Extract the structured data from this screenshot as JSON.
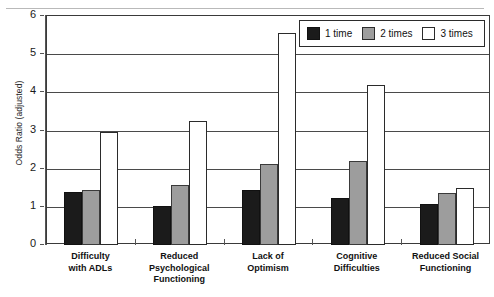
{
  "chart_data": {
    "type": "bar",
    "title": "",
    "xlabel": "",
    "ylabel": "Odds Ratio (adjusted)",
    "ylim": [
      0,
      6
    ],
    "yticks": [
      0,
      1,
      2,
      3,
      4,
      5,
      6
    ],
    "grid": true,
    "legend_position": "top-right",
    "categories": [
      "Difficulty with ADLs",
      "Reduced Psychological Functioning",
      "Lack of Optimism",
      "Cognitive Difficulties",
      "Reduced Social Functioning"
    ],
    "category_lines": [
      [
        "Difficulty",
        "with ADLs"
      ],
      [
        "Reduced",
        "Psychological",
        "Functioning"
      ],
      [
        "Lack of",
        "Optimism"
      ],
      [
        "Cognitive",
        "Difficulties"
      ],
      [
        "Reduced Social",
        "Functioning"
      ]
    ],
    "series": [
      {
        "name": "1 time",
        "color": "#1b1b1b",
        "values": [
          1.4,
          1.03,
          1.45,
          1.22,
          1.07
        ]
      },
      {
        "name": "2 times",
        "color": "#9d9d9d",
        "values": [
          1.45,
          1.57,
          2.11,
          2.21,
          1.35
        ]
      },
      {
        "name": "3 times",
        "color": "#ffffff",
        "values": [
          2.95,
          3.25,
          5.55,
          4.2,
          1.5
        ]
      }
    ]
  },
  "legend": {
    "items": [
      {
        "label": "1 time",
        "swatch": "black-swatch"
      },
      {
        "label": "2 times",
        "swatch": "gray-swatch"
      },
      {
        "label": "3 times",
        "swatch": "white-swatch"
      }
    ]
  },
  "axis": {
    "y_label": "Odds Ratio (adjusted)",
    "y_ticks": [
      "0",
      "1",
      "2",
      "3",
      "4",
      "5",
      "6"
    ]
  }
}
